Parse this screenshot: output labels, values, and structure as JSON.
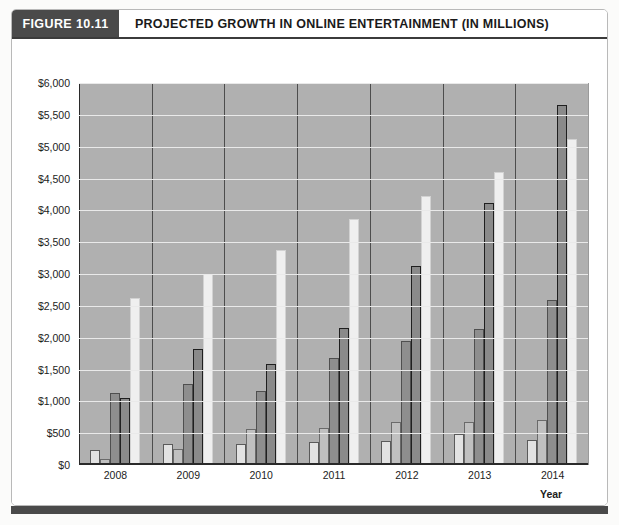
{
  "figure": {
    "tag": "FIGURE 10.11",
    "title": "PROJECTED GROWTH IN ONLINE ENTERTAINMENT (IN MILLIONS)"
  },
  "chart_data": {
    "type": "bar",
    "title": "PROJECTED GROWTH IN ONLINE ENTERTAINMENT (IN MILLIONS)",
    "xlabel": "Year",
    "ylabel": "",
    "categories": [
      "2008",
      "2009",
      "2010",
      "2011",
      "2012",
      "2013",
      "2014"
    ],
    "ylim": [
      0,
      6000
    ],
    "ytick_step": 500,
    "ytick_labels": [
      "$0",
      "$500",
      "$1,000",
      "$1,500",
      "$2,000",
      "$2,500",
      "$3,000",
      "$3,500",
      "$4,000",
      "$4,500",
      "$5,000",
      "$5,500",
      "$6,000"
    ],
    "grid": true,
    "legend_position": "bottom",
    "series": [
      {
        "name": "Online TV",
        "color": "#e2e2e2",
        "values": [
          230,
          330,
          330,
          360,
          380,
          480,
          400
        ]
      },
      {
        "name": "Internet Radio",
        "color": "#c0c0c0",
        "values": [
          100,
          250,
          560,
          580,
          670,
          680,
          700
        ]
      },
      {
        "name": "Online Video Games",
        "color": "#8e8e8e",
        "values": [
          1130,
          1270,
          1160,
          1680,
          1950,
          2130,
          2590
        ]
      },
      {
        "name": "Online Video",
        "color": "#8a8a8a",
        "values": [
          1050,
          1830,
          1590,
          2150,
          3120,
          4120,
          5650
        ]
      },
      {
        "name": "Online Music",
        "color": "#efefef",
        "values": [
          2630,
          3000,
          3380,
          3870,
          4230,
          4600,
          5120
        ]
      }
    ]
  }
}
